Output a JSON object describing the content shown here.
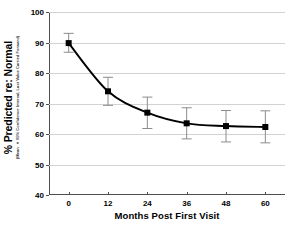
{
  "chart_data": {
    "type": "line",
    "title": "",
    "xlabel": "Months Post First Visit",
    "ylabel": "% Predicted re: Normal",
    "ylabel_sub": "(Mean ± 95% Confidence Interval, Last Value Carried Forward)",
    "x": [
      0,
      12,
      24,
      36,
      48,
      60
    ],
    "xtick_labels": [
      "0",
      "12",
      "24",
      "36",
      "48",
      "60"
    ],
    "ytick_labels": [
      "40",
      "50",
      "60",
      "70",
      "80",
      "90",
      "100"
    ],
    "ytick_values": [
      40,
      50,
      60,
      70,
      80,
      90,
      100
    ],
    "xlim": [
      -6,
      66
    ],
    "ylim": [
      40,
      100
    ],
    "grid": true,
    "legend": "none",
    "series": [
      {
        "name": "% Predicted re: Normal",
        "values": [
          89.8,
          74.0,
          67.0,
          63.5,
          62.6,
          62.3
        ],
        "error_low": [
          86.8,
          69.4,
          61.8,
          58.4,
          57.4,
          57.1
        ],
        "error_high": [
          93.0,
          78.6,
          72.1,
          68.6,
          67.7,
          67.6
        ],
        "marker": "square",
        "color": "#000000"
      }
    ]
  },
  "axes": {
    "x_title": "Months Post First Visit",
    "y_title": "% Predicted re: Normal",
    "y_subtitle": "(Mean ± 95% Confidence Interval, Last Value Carried Forward)"
  },
  "colors": {
    "line": "#000000",
    "marker": "#000000",
    "error_bar": "#8c8c8c",
    "grid": "#d2d2d2",
    "axis": "#4d4d4d",
    "background": "#ffffff"
  }
}
